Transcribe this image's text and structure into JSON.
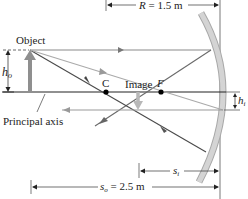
{
  "diagram": {
    "type": "concave-mirror-ray-diagram",
    "labels": {
      "object": "Object",
      "image": "Image",
      "principal_axis": "Principal axis",
      "center": "C",
      "focal": "F",
      "h_o": "h",
      "h_o_sub": "o",
      "h_i": "h",
      "h_i_sub": "i",
      "R_label": "R = 1.5 m",
      "s_i": "s",
      "s_i_sub": "i",
      "s_o_var": "s",
      "s_o_sub": "o",
      "s_o_value": " = 2.5 m"
    },
    "values": {
      "R": "1.5 m",
      "s_o": "2.5 m"
    },
    "colors": {
      "ray_dark": "#4a4a4a",
      "ray_light": "#9a9a9a",
      "mirror": "#c8c8c8",
      "mirror_edge": "#a8a8a8",
      "arrow": "#8f8f8f",
      "axis": "#222222"
    }
  }
}
